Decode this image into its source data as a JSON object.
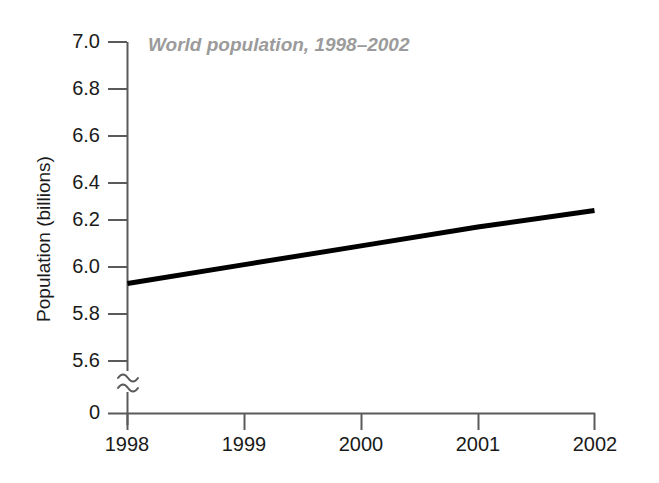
{
  "chart_data": {
    "type": "line",
    "title": "World population, 1998–2002",
    "xlabel": "",
    "ylabel": "Population (billions)",
    "categories": [
      "1998",
      "1999",
      "2000",
      "2001",
      "2002"
    ],
    "x": [
      1998,
      1999,
      2000,
      2001,
      2002
    ],
    "series": [
      {
        "name": "World population",
        "values": [
          5.93,
          6.01,
          6.09,
          6.17,
          6.24
        ]
      }
    ],
    "ylim": [
      5.6,
      7.0
    ],
    "xlim": [
      1998,
      2002
    ],
    "y_ticks": [
      "7.0",
      "6.8",
      "6.6",
      "6.4",
      "6.2",
      "6.0",
      "5.8",
      "5.6",
      "0"
    ],
    "y_tick_values": [
      7.0,
      6.8,
      6.6,
      6.4,
      6.2,
      6.0,
      5.8,
      5.6,
      0
    ],
    "x_ticks": [
      "1998",
      "1999",
      "2000",
      "2001",
      "2002"
    ],
    "grid": false,
    "legend": null,
    "axis_break": true,
    "axis_break_label": "≈",
    "line_color": "#000000",
    "title_color": "#9b9b9b",
    "axis_color": "#5a5a5a",
    "background": "#ffffff"
  },
  "labels": {
    "y_axis_title": "Population (billions)",
    "chart_title": "World population, 1998–2002",
    "y0": "7.0",
    "y1": "6.8",
    "y2": "6.6",
    "y3": "6.4",
    "y4": "6.2",
    "y5": "6.0",
    "y6": "5.8",
    "y7": "5.6",
    "y8": "0",
    "x0": "1998",
    "x1": "1999",
    "x2": "2000",
    "x3": "2001",
    "x4": "2002"
  }
}
